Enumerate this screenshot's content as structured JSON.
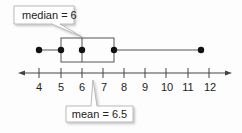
{
  "diagram": {
    "type": "box-and-whisker",
    "axis": {
      "min": 4,
      "max": 12,
      "tick_labels": [
        "4",
        "5",
        "6",
        "7",
        "8",
        "9",
        "10",
        "11",
        "12"
      ]
    },
    "five_number_summary": {
      "min": 4,
      "q1": 5,
      "median": 6,
      "q3": 7.5,
      "max": 11
    },
    "callouts": {
      "median": "median = 6",
      "mean": "mean = 6.5"
    },
    "colors": {
      "line": "#444444",
      "point": "#111111",
      "callout_border": "#999999",
      "callout_fill": "#ffffff"
    }
  }
}
